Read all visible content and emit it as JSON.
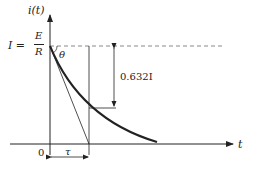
{
  "diagram": {
    "y_axis_label": "i(t)",
    "x_axis_label": "t",
    "origin_label": "0",
    "initial_value": {
      "lhs": "I =",
      "num": "E",
      "den": "R"
    },
    "angle_label": "θ",
    "amplitude_label": "0.632I",
    "tau_label": "τ",
    "colors": {
      "stroke": "#222222",
      "dashed": "#888888"
    }
  }
}
